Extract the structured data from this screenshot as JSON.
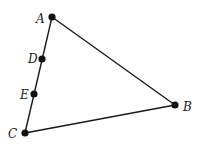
{
  "diagram": {
    "type": "geometry-triangle",
    "colors": {
      "line": "#1a1a1a",
      "point": "#111111",
      "label": "#222222",
      "background": "#ffffff"
    },
    "points": {
      "A": {
        "label": "A",
        "x": 52,
        "y": 17,
        "lx": 36,
        "ly": 23
      },
      "D": {
        "label": "D",
        "x": 42,
        "y": 59,
        "lx": 28,
        "ly": 63
      },
      "E": {
        "label": "E",
        "x": 34,
        "y": 94,
        "lx": 20,
        "ly": 99
      },
      "C": {
        "label": "C",
        "x": 25,
        "y": 133,
        "lx": 8,
        "ly": 138
      },
      "B": {
        "label": "B",
        "x": 175,
        "y": 105,
        "lx": 183,
        "ly": 111
      }
    },
    "segments": [
      {
        "from": "A",
        "to": "B"
      },
      {
        "from": "B",
        "to": "C"
      },
      {
        "from": "C",
        "to": "A"
      }
    ],
    "points_on_segment": {
      "segment": "AC",
      "points": [
        "D",
        "E"
      ]
    }
  }
}
